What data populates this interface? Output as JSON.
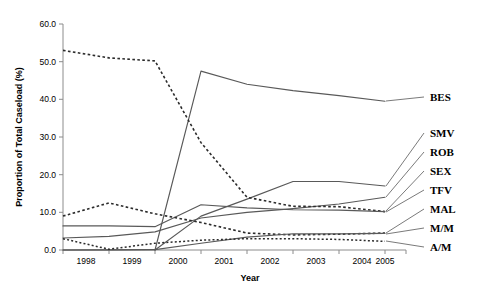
{
  "chart_data": {
    "type": "line",
    "title": "",
    "xlabel": "Year",
    "ylabel": "Proportion of Total Caseload (%)",
    "categories": [
      "1998",
      "1999",
      "2000",
      "2001",
      "2002",
      "2003",
      "2004",
      "2005"
    ],
    "x": [
      1998,
      1999,
      2000,
      2001,
      2002,
      2003,
      2004,
      2005
    ],
    "xlim": [
      1998,
      2005
    ],
    "ylim": [
      0.0,
      60.0
    ],
    "yticks": [
      "0.0",
      "10.0",
      "20.0",
      "30.0",
      "40.0",
      "50.0",
      "60.0"
    ],
    "ytick_values": [
      0.0,
      10.0,
      20.0,
      30.0,
      40.0,
      50.0,
      60.0
    ],
    "grid": false,
    "legend_position": "right-outside",
    "series": [
      {
        "name": "BES",
        "label": "BES",
        "style": "solid",
        "values": [
          0.0,
          0.0,
          0.0,
          47.5,
          44.0,
          42.3,
          41.0,
          39.5
        ]
      },
      {
        "name": "SMV",
        "label": "SMV",
        "style": "solid",
        "values": [
          0.0,
          0.0,
          0.0,
          9.0,
          13.5,
          18.2,
          18.2,
          17.0
        ]
      },
      {
        "name": "ROB",
        "label": "ROB",
        "style": "solid",
        "values": [
          3.2,
          3.6,
          4.8,
          8.5,
          10.0,
          11.0,
          12.2,
          14.0
        ]
      },
      {
        "name": "SEX",
        "label": "SEX",
        "style": "dashed",
        "values": [
          53.0,
          51.0,
          50.2,
          28.5,
          14.0,
          11.6,
          11.5,
          10.2
        ]
      },
      {
        "name": "TFV",
        "label": "TFV",
        "style": "solid",
        "values": [
          6.4,
          6.4,
          6.2,
          12.0,
          11.2,
          10.7,
          10.6,
          10.2
        ]
      },
      {
        "name": "MAL",
        "label": "MAL",
        "style": "dashed",
        "values": [
          9.0,
          12.5,
          9.6,
          7.3,
          4.5,
          4.0,
          4.2,
          4.5
        ]
      },
      {
        "name": "M/M",
        "label": "M/M",
        "style": "solid",
        "values": [
          0.0,
          0.0,
          0.1,
          1.8,
          3.4,
          4.3,
          4.3,
          4.4
        ]
      },
      {
        "name": "A/M",
        "label": "A/M",
        "style": "dotted",
        "values": [
          3.0,
          0.2,
          1.8,
          2.6,
          3.0,
          3.0,
          2.8,
          2.3
        ]
      }
    ]
  }
}
